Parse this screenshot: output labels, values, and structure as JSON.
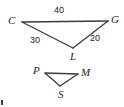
{
  "figure": {
    "background_color": "#ffffff",
    "stroke_color": "#3a3a3a",
    "text_color": "#231f20",
    "width": 124,
    "height": 107,
    "upper_triangle": {
      "name": "triangle-CGL",
      "vertices": [
        {
          "label": "C",
          "x": 22,
          "y": 22,
          "label_x": 8,
          "label_y": 15
        },
        {
          "label": "G",
          "x": 108,
          "y": 21,
          "label_x": 111,
          "label_y": 14
        },
        {
          "label": "L",
          "x": 73,
          "y": 48,
          "label_x": 70,
          "label_y": 51
        }
      ],
      "sides": [
        {
          "name": "CG",
          "value": "40",
          "label_x": 54,
          "label_y": 6
        },
        {
          "name": "CL",
          "value": "30",
          "label_x": 30,
          "label_y": 36
        },
        {
          "name": "GL",
          "value": "20",
          "label_x": 90,
          "label_y": 34
        }
      ]
    },
    "lower_triangle": {
      "name": "triangle-PMS",
      "vertices": [
        {
          "label": "P",
          "x": 45,
          "y": 73,
          "label_x": 33,
          "label_y": 65
        },
        {
          "label": "M",
          "x": 78,
          "y": 74,
          "label_x": 81,
          "label_y": 67
        },
        {
          "label": "S",
          "x": 60,
          "y": 86,
          "label_x": 58,
          "label_y": 89
        }
      ],
      "sides": []
    },
    "corner_mark": {
      "name": "page-edge-artifact",
      "visible": true
    }
  }
}
